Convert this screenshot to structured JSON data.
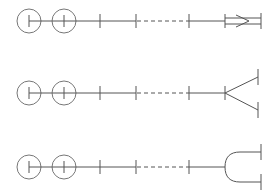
{
  "diagram": {
    "title": "",
    "background": "#ffffff",
    "line_color": "#555555",
    "rows": [
      {
        "name": "row-1",
        "terminal": "double-line-with-arrow",
        "y": 21
      },
      {
        "name": "row-2",
        "terminal": "v-fork",
        "y": 93
      },
      {
        "name": "row-3",
        "terminal": "rounded-fork",
        "y": 167
      }
    ]
  }
}
